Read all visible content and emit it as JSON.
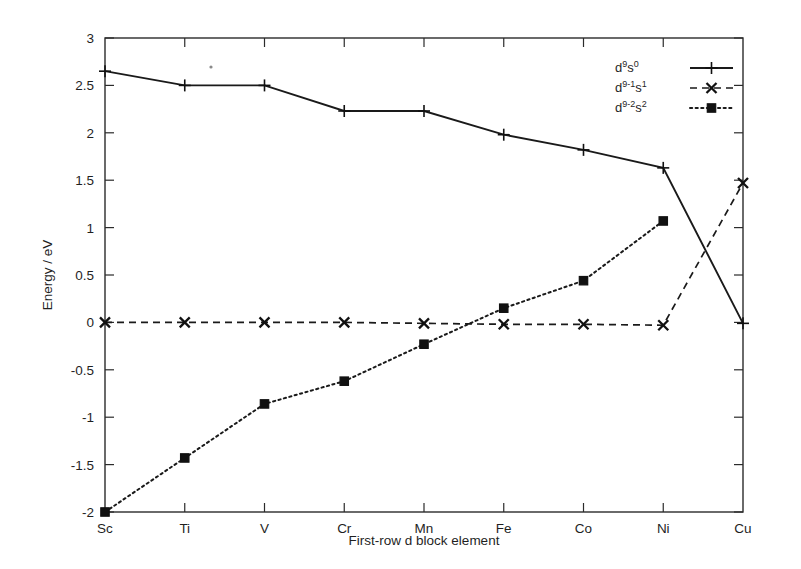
{
  "chart_data": {
    "type": "line",
    "title": "",
    "xlabel": "First-row d block element",
    "ylabel": "Energy / eV",
    "categories": [
      "Sc",
      "Ti",
      "V",
      "Cr",
      "Mn",
      "Fe",
      "Co",
      "Ni",
      "Cu"
    ],
    "ylim": [
      -2,
      3
    ],
    "yticks": [
      -2,
      -1.5,
      -1,
      -0.5,
      0,
      0.5,
      1,
      1.5,
      2,
      2.5,
      3
    ],
    "ytick_labels": [
      "-2",
      "-1.5",
      "-1",
      "-0.5",
      "0",
      "0.5",
      "1",
      "1.5",
      "2",
      "2.5",
      "3"
    ],
    "grid": false,
    "legend_position": "top-right",
    "frame": "box",
    "series": [
      {
        "name": "d9 s0",
        "label_base": "d",
        "label_sup1": "9",
        "label_mid": "s",
        "label_sup2": "0",
        "marker": "plus",
        "linestyle": "solid",
        "color": "#1a1a1a",
        "values": [
          2.65,
          2.5,
          2.5,
          2.23,
          2.23,
          1.98,
          1.82,
          1.63,
          -0.01
        ]
      },
      {
        "name": "d9-1 s1",
        "label_base": "d",
        "label_sup1": "9-1",
        "label_mid": "s",
        "label_sup2": "1",
        "marker": "cross",
        "linestyle": "dashed",
        "color": "#1a1a1a",
        "values": [
          0.0,
          0.0,
          0.0,
          0.0,
          -0.01,
          -0.02,
          -0.02,
          -0.03,
          1.47
        ]
      },
      {
        "name": "d9-2 s2",
        "label_base": "d",
        "label_sup1": "9-2",
        "label_mid": "s",
        "label_sup2": "2",
        "marker": "square",
        "linestyle": "dotted",
        "color": "#1a1a1a",
        "values": [
          -2.0,
          -1.43,
          -0.86,
          -0.62,
          -0.23,
          0.15,
          0.44,
          1.07,
          null
        ]
      }
    ]
  },
  "legend": {
    "entries": [
      {
        "base": "d",
        "sup1": "9",
        "mid": "s",
        "sup2": "0"
      },
      {
        "base": "d",
        "sup1": "9-1",
        "mid": "s",
        "sup2": "1"
      },
      {
        "base": "d",
        "sup1": "9-2",
        "mid": "s",
        "sup2": "2"
      }
    ]
  }
}
